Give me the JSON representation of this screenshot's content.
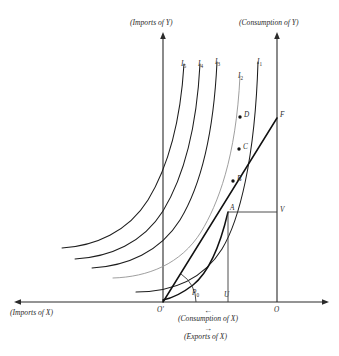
{
  "figure": {
    "background_color": "#ffffff",
    "ink_color": "#1d1d1d"
  },
  "axes": {
    "vertical_left": {
      "label": "(Imports of Y)",
      "x": 163,
      "top": 33,
      "bottom": 303
    },
    "vertical_right": {
      "label": "(Consumption of Y)",
      "x": 277,
      "top": 33,
      "bottom": 303
    },
    "horizontal": {
      "left_label": "(Imports of X)",
      "center_label": "(Consumption of X)",
      "lower_label": "(Exports of X)",
      "center_arrow": "←",
      "lower_arrow": "→",
      "y": 302,
      "left": 14,
      "right": 329
    }
  },
  "origins": [
    {
      "name": "origin-trade",
      "label": "O′",
      "x": 163,
      "y": 302
    },
    {
      "name": "origin-consumption",
      "label": "O",
      "x": 277,
      "y": 302
    }
  ],
  "curves": {
    "indifference": [
      {
        "id": "I5",
        "label": "I",
        "sub": "5"
      },
      {
        "id": "I4",
        "label": "I",
        "sub": "4"
      },
      {
        "id": "I3",
        "label": "I",
        "sub": "3"
      },
      {
        "id": "I2",
        "label": "I",
        "sub": "2"
      },
      {
        "id": "I1",
        "label": "I",
        "sub": "1"
      }
    ],
    "offer_curve_name": "offer-curve",
    "trade_line_name": "terms-of-trade-line"
  },
  "points": [
    {
      "id": "D",
      "label": "D",
      "x": 243,
      "y": 117,
      "dot": true
    },
    {
      "id": "C",
      "label": "C",
      "x": 242,
      "y": 149,
      "dot": true
    },
    {
      "id": "B",
      "label": "B",
      "x": 236,
      "y": 180,
      "dot": true
    },
    {
      "id": "A",
      "label": "A",
      "x": 228,
      "y": 212,
      "dot": false
    },
    {
      "id": "F",
      "label": "F",
      "x": 277,
      "y": 118,
      "dot": false
    },
    {
      "id": "V",
      "label": "V",
      "x": 277,
      "y": 213,
      "dot": false
    },
    {
      "id": "U",
      "label": "U",
      "x": 228,
      "y": 302,
      "dot": false
    },
    {
      "id": "P0",
      "label": "P",
      "sub": "0",
      "x": 196,
      "y": 294,
      "dot": false
    }
  ]
}
